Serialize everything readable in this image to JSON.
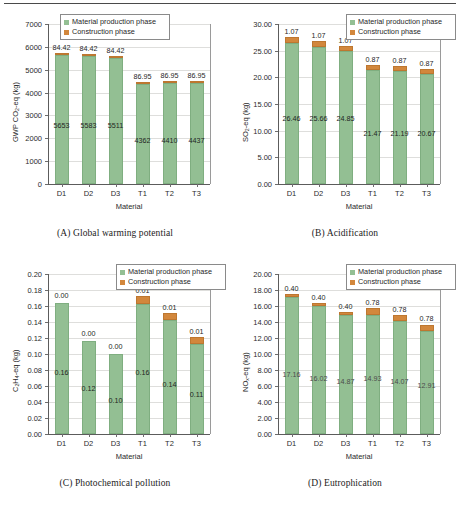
{
  "figure": {
    "panels": [
      {
        "caption": "(A) Global warming potential",
        "ylabel_html": "GWP CO<sub>2</sub>-eq (kg)",
        "xlabel": "Material",
        "legend": {
          "material": "Material production phase",
          "construction": "Construction phase"
        }
      },
      {
        "caption": "(B) Acidification",
        "ylabel_html": "SO<sub>2</sub>-eq (kg)",
        "xlabel": "Material",
        "legend": {
          "material": "Material production phase",
          "construction": "Construction phase"
        }
      },
      {
        "caption": "(C) Photochemical pollution",
        "ylabel_html": "C<sub>2</sub>H<sub>4</sub>-eq (kg)",
        "xlabel": "Material",
        "legend": {
          "material": "Material production phase",
          "construction": "Construction phase"
        }
      },
      {
        "caption": "(D) Eutrophication",
        "ylabel_html": "NO<sub>x</sub>-eq (kg)",
        "xlabel": "Material",
        "legend": {
          "material": "Material production phase",
          "construction": "Construction phase"
        }
      }
    ]
  },
  "colors": {
    "material_phase": "#93bf93",
    "construction_phase": "#d2873c",
    "axis": "#5c5c5c",
    "gridline": "#dededc"
  },
  "chart_data": [
    {
      "type": "bar",
      "stacked": true,
      "title": "(A) Global warming potential",
      "xlabel": "Material",
      "ylabel": "GWP CO2-eq (kg)",
      "categories": [
        "D1",
        "D2",
        "D3",
        "T1",
        "T2",
        "T3"
      ],
      "ylim": [
        0,
        7000
      ],
      "yticks": [
        0,
        1000,
        2000,
        3000,
        4000,
        5000,
        6000,
        7000
      ],
      "ytick_labels": [
        "0",
        "1000",
        "2000",
        "3000",
        "4000",
        "5000",
        "6000",
        "7000"
      ],
      "grid": true,
      "legend_position": "upper-center",
      "series": [
        {
          "name": "Material production phase",
          "values": [
            5653,
            5583,
            5511,
            4362,
            4410,
            4437
          ],
          "labels": [
            "5653",
            "5583",
            "5511",
            "4362",
            "4410",
            "4437"
          ]
        },
        {
          "name": "Construction phase",
          "values": [
            84.42,
            84.42,
            84.42,
            86.95,
            86.95,
            86.95
          ],
          "labels": [
            "84.42",
            "84.42",
            "84.42",
            "86.95",
            "86.95",
            "86.95"
          ]
        }
      ]
    },
    {
      "type": "bar",
      "stacked": true,
      "title": "(B) Acidification",
      "xlabel": "Material",
      "ylabel": "SO2-eq (kg)",
      "categories": [
        "D1",
        "D2",
        "D3",
        "T1",
        "T2",
        "T3"
      ],
      "ylim": [
        0,
        30
      ],
      "yticks": [
        0,
        5,
        10,
        15,
        20,
        25,
        30
      ],
      "ytick_labels": [
        "0.00",
        "5.00",
        "10.00",
        "15.00",
        "20.00",
        "25.00",
        "30.00"
      ],
      "grid": true,
      "legend_position": "upper-right",
      "series": [
        {
          "name": "Material production phase",
          "values": [
            26.46,
            25.66,
            24.85,
            21.47,
            21.19,
            20.67
          ],
          "labels": [
            "26.46",
            "25.66",
            "24.85",
            "21.47",
            "21.19",
            "20.67"
          ]
        },
        {
          "name": "Construction phase",
          "values": [
            1.07,
            1.07,
            1.07,
            0.87,
            0.87,
            0.87
          ],
          "labels": [
            "1.07",
            "1.07",
            "1.07",
            "0.87",
            "0.87",
            "0.87"
          ]
        }
      ]
    },
    {
      "type": "bar",
      "stacked": true,
      "title": "(C) Photochemical pollution",
      "xlabel": "Material",
      "ylabel": "C2H4-eq (kg)",
      "categories": [
        "D1",
        "D2",
        "D3",
        "T1",
        "T2",
        "T3"
      ],
      "ylim": [
        0,
        0.2
      ],
      "yticks": [
        0,
        0.02,
        0.04,
        0.06,
        0.08,
        0.1,
        0.12,
        0.14,
        0.16,
        0.18,
        0.2
      ],
      "ytick_labels": [
        "0.00",
        "0.02",
        "0.04",
        "0.06",
        "0.08",
        "0.10",
        "0.12",
        "0.14",
        "0.16",
        "0.18",
        "0.20"
      ],
      "grid": true,
      "legend_position": "upper-right",
      "series": [
        {
          "name": "Material production phase",
          "values": [
            0.164,
            0.116,
            0.1,
            0.163,
            0.143,
            0.113
          ],
          "labels": [
            "0.16",
            "0.12",
            "0.10",
            "0.16",
            "0.14",
            "0.11"
          ]
        },
        {
          "name": "Construction phase",
          "values": [
            0.0,
            0.0,
            0.0,
            0.009,
            0.008,
            0.008
          ],
          "labels": [
            "0.00",
            "0.00",
            "0.00",
            "0.01",
            "0.01",
            "0.01"
          ]
        }
      ]
    },
    {
      "type": "bar",
      "stacked": true,
      "title": "(D) Eutrophication",
      "xlabel": "Material",
      "ylabel": "NOx-eq (kg)",
      "categories": [
        "D1",
        "D2",
        "D3",
        "T1",
        "T2",
        "T3"
      ],
      "ylim": [
        0,
        20
      ],
      "yticks": [
        0,
        2,
        4,
        6,
        8,
        10,
        12,
        14,
        16,
        18,
        20
      ],
      "ytick_labels": [
        "0.00",
        "2.00",
        "4.00",
        "6.00",
        "8.00",
        "10.00",
        "12.00",
        "14.00",
        "16.00",
        "18.00",
        "20.00"
      ],
      "grid": true,
      "legend_position": "upper-right",
      "series": [
        {
          "name": "Material production phase",
          "values": [
            17.16,
            16.02,
            14.87,
            14.93,
            14.07,
            12.91
          ],
          "labels": [
            "17.16",
            "16.02",
            "14.87",
            "14.93",
            "14.07",
            "12.91"
          ]
        },
        {
          "name": "Construction phase",
          "values": [
            0.4,
            0.4,
            0.4,
            0.78,
            0.78,
            0.78
          ],
          "labels": [
            "0.40",
            "0.40",
            "0.40",
            "0.78",
            "0.78",
            "0.78"
          ]
        }
      ]
    }
  ]
}
